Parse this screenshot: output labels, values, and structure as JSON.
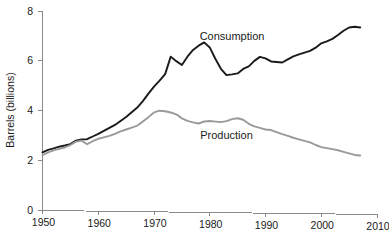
{
  "chart_data": {
    "type": "line",
    "title": "",
    "xlabel": "",
    "ylabel": "Barrels (billions)",
    "xlim": [
      1950,
      2010
    ],
    "ylim": [
      0,
      8
    ],
    "xticks": [
      1950,
      1960,
      1970,
      1980,
      1990,
      2000,
      2010
    ],
    "xtick_labels": [
      "1950",
      "1960",
      "1970",
      "1980",
      "1990",
      "2000",
      "2010"
    ],
    "yticks": [
      0,
      2,
      4,
      6,
      8
    ],
    "ytick_labels": [
      "0",
      "2",
      "4",
      "6",
      "8"
    ],
    "grid": false,
    "legend_position": "inline-annotations",
    "annotations": [
      {
        "text": "Consumption",
        "x": 1984,
        "y": 7.0
      },
      {
        "text": "Production",
        "x": 1983,
        "y": 3.05
      }
    ],
    "series": [
      {
        "name": "Consumption",
        "color": "#1a1a1a",
        "linewidth": 1.9,
        "x": [
          1950,
          1951,
          1952,
          1953,
          1954,
          1955,
          1956,
          1957,
          1958,
          1959,
          1960,
          1961,
          1962,
          1963,
          1964,
          1965,
          1966,
          1967,
          1968,
          1969,
          1970,
          1971,
          1972,
          1973,
          1974,
          1975,
          1976,
          1977,
          1978,
          1979,
          1980,
          1981,
          1982,
          1983,
          1984,
          1985,
          1986,
          1987,
          1988,
          1989,
          1990,
          1991,
          1992,
          1993,
          1994,
          1995,
          1996,
          1997,
          1998,
          1999,
          2000,
          2001,
          2002,
          2003,
          2004,
          2005,
          2006,
          2007
        ],
        "values": [
          2.32,
          2.42,
          2.48,
          2.55,
          2.6,
          2.66,
          2.8,
          2.85,
          2.86,
          2.97,
          3.08,
          3.2,
          3.32,
          3.44,
          3.6,
          3.76,
          3.95,
          4.14,
          4.4,
          4.7,
          4.98,
          5.22,
          5.48,
          6.18,
          6.0,
          5.85,
          6.18,
          6.45,
          6.62,
          6.75,
          6.55,
          6.1,
          5.7,
          5.45,
          5.48,
          5.52,
          5.7,
          5.8,
          6.02,
          6.18,
          6.12,
          6.0,
          5.98,
          5.96,
          6.08,
          6.2,
          6.28,
          6.35,
          6.42,
          6.55,
          6.72,
          6.8,
          6.9,
          7.05,
          7.22,
          7.35,
          7.38,
          7.35
        ]
      },
      {
        "name": "Production",
        "color": "#9a9a9a",
        "linewidth": 1.9,
        "x": [
          1950,
          1951,
          1952,
          1953,
          1954,
          1955,
          1956,
          1957,
          1958,
          1959,
          1960,
          1961,
          1962,
          1963,
          1964,
          1965,
          1966,
          1967,
          1968,
          1969,
          1970,
          1971,
          1972,
          1973,
          1974,
          1975,
          1976,
          1977,
          1978,
          1979,
          1980,
          1981,
          1982,
          1983,
          1984,
          1985,
          1986,
          1987,
          1988,
          1989,
          1990,
          1991,
          1992,
          1993,
          1994,
          1995,
          1996,
          1997,
          1998,
          1999,
          2000,
          2001,
          2002,
          2003,
          2004,
          2005,
          2006,
          2007
        ],
        "values": [
          2.2,
          2.32,
          2.4,
          2.46,
          2.52,
          2.62,
          2.76,
          2.8,
          2.66,
          2.78,
          2.88,
          2.94,
          3.0,
          3.08,
          3.18,
          3.26,
          3.34,
          3.42,
          3.58,
          3.76,
          3.95,
          4.02,
          4.0,
          3.95,
          3.88,
          3.72,
          3.62,
          3.56,
          3.52,
          3.6,
          3.62,
          3.6,
          3.58,
          3.62,
          3.7,
          3.74,
          3.68,
          3.52,
          3.42,
          3.36,
          3.3,
          3.28,
          3.2,
          3.12,
          3.05,
          2.98,
          2.92,
          2.86,
          2.8,
          2.7,
          2.62,
          2.58,
          2.54,
          2.5,
          2.44,
          2.38,
          2.32,
          2.3
        ]
      }
    ]
  },
  "axes": {
    "y_axis_title": "Barrels (billions)"
  }
}
